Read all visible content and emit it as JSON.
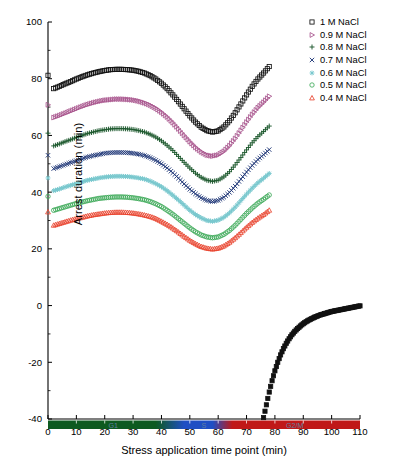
{
  "chart_data": {
    "type": "scatter",
    "title": "",
    "xlabel": "Stress application time point (min)",
    "ylabel": "Arrest duration (min)",
    "xlim": [
      0,
      110
    ],
    "ylim": [
      -40,
      100
    ],
    "xticks": [
      0,
      10,
      20,
      30,
      40,
      50,
      60,
      70,
      80,
      90,
      100,
      110
    ],
    "xticklabels": [
      "0",
      "10",
      "20",
      "30",
      "40",
      "50",
      "60",
      "70",
      "80",
      "90",
      "100",
      "110"
    ],
    "yticks": [
      -40,
      -20,
      0,
      20,
      40,
      60,
      80,
      100
    ],
    "yticklabels": [
      "-40",
      "-20",
      "0",
      "20",
      "40",
      "60",
      "80",
      "100"
    ],
    "grid": false,
    "legend_position": "top-right",
    "x": [
      0,
      2,
      4,
      6,
      8,
      10,
      12,
      14,
      16,
      18,
      20,
      22,
      24,
      26,
      28,
      30,
      32,
      34,
      36,
      38,
      40,
      42,
      44,
      46,
      48,
      50,
      52,
      54,
      56,
      58,
      60,
      62,
      64,
      66,
      68,
      70,
      72,
      74,
      76,
      78
    ],
    "series": [
      {
        "name": "1 M NaCl",
        "color": "#111111",
        "marker": "square-open",
        "values": [
          81.2,
          76.5,
          77.3,
          78.2,
          79.0,
          79.9,
          80.7,
          81.4,
          82.0,
          82.5,
          82.9,
          83.2,
          83.3,
          83.3,
          83.2,
          83.0,
          82.6,
          82.0,
          81.1,
          79.9,
          78.4,
          76.5,
          74.3,
          71.9,
          69.4,
          66.9,
          64.7,
          62.9,
          61.7,
          61.2,
          61.6,
          63.0,
          65.2,
          68.0,
          71.1,
          74.3,
          77.3,
          79.9,
          82.0,
          84.3
        ]
      },
      {
        "name": "0.9 M NaCl",
        "color": "#a8548c",
        "marker": "triangle-right-open",
        "values": [
          70.8,
          66.3,
          67.0,
          67.8,
          68.6,
          69.4,
          70.2,
          70.9,
          71.5,
          72.0,
          72.4,
          72.6,
          72.8,
          72.8,
          72.7,
          72.5,
          72.1,
          71.5,
          70.7,
          69.6,
          68.2,
          66.5,
          64.5,
          62.3,
          60.0,
          57.8,
          55.8,
          54.2,
          53.1,
          52.7,
          53.1,
          54.4,
          56.4,
          58.9,
          61.8,
          64.7,
          67.4,
          69.8,
          71.7,
          73.8
        ]
      },
      {
        "name": "0.8 M NaCl",
        "color": "#1e5a2e",
        "marker": "plus",
        "values": [
          60.8,
          56.3,
          57.0,
          57.8,
          58.5,
          59.3,
          60.0,
          60.7,
          61.2,
          61.7,
          62.0,
          62.3,
          62.4,
          62.4,
          62.3,
          62.1,
          61.7,
          61.2,
          60.4,
          59.4,
          58.1,
          56.5,
          54.7,
          52.6,
          50.5,
          48.5,
          46.7,
          45.2,
          44.2,
          43.8,
          44.2,
          45.4,
          47.2,
          49.6,
          52.2,
          54.9,
          57.4,
          59.6,
          61.4,
          63.3
        ]
      },
      {
        "name": "0.7 M NaCl",
        "color": "#243b7a",
        "marker": "x",
        "values": [
          53.0,
          48.3,
          49.0,
          49.7,
          50.4,
          51.1,
          51.8,
          52.4,
          52.9,
          53.3,
          53.7,
          53.9,
          54.0,
          54.0,
          53.9,
          53.7,
          53.4,
          52.9,
          52.2,
          51.2,
          50.0,
          48.5,
          46.8,
          44.9,
          42.9,
          41.0,
          39.4,
          38.0,
          37.1,
          36.7,
          37.1,
          38.2,
          39.9,
          42.1,
          44.6,
          47.1,
          49.4,
          51.5,
          53.2,
          55.0
        ]
      },
      {
        "name": "0.6 M NaCl",
        "color": "#79c8ce",
        "marker": "star-dot",
        "values": [
          45.0,
          40.5,
          41.1,
          41.8,
          42.4,
          43.0,
          43.6,
          44.2,
          44.6,
          45.0,
          45.3,
          45.5,
          45.6,
          45.6,
          45.5,
          45.3,
          45.0,
          44.6,
          43.9,
          43.0,
          41.9,
          40.5,
          38.9,
          37.2,
          35.4,
          33.6,
          32.1,
          30.9,
          30.0,
          29.7,
          30.1,
          31.1,
          32.7,
          34.7,
          37.0,
          39.3,
          41.4,
          43.3,
          44.9,
          46.6
        ]
      },
      {
        "name": "0.5 M NaCl",
        "color": "#3faa5a",
        "marker": "circle-open",
        "values": [
          38.5,
          33.6,
          34.2,
          34.8,
          35.4,
          36.0,
          36.5,
          37.0,
          37.4,
          37.8,
          38.0,
          38.2,
          38.3,
          38.3,
          38.2,
          38.0,
          37.7,
          37.3,
          36.7,
          35.9,
          34.9,
          33.6,
          32.2,
          30.6,
          29.0,
          27.4,
          26.0,
          24.9,
          24.2,
          23.9,
          24.2,
          25.1,
          26.5,
          28.3,
          30.4,
          32.5,
          34.4,
          36.1,
          37.5,
          39.0
        ]
      },
      {
        "name": "0.4 M NaCl",
        "color": "#e8452f",
        "marker": "triangle-up-open",
        "values": [
          33.0,
          28.3,
          28.9,
          29.5,
          30.1,
          30.6,
          31.1,
          31.6,
          32.0,
          32.3,
          32.6,
          32.8,
          32.9,
          32.9,
          32.8,
          32.6,
          32.3,
          31.9,
          31.4,
          30.7,
          29.7,
          28.6,
          27.3,
          25.9,
          24.4,
          23.0,
          21.8,
          20.8,
          20.2,
          19.9,
          20.2,
          21.0,
          22.3,
          23.9,
          25.7,
          27.6,
          29.3,
          30.8,
          32.1,
          33.6
        ]
      },
      {
        "name": "recovery",
        "color": "#111111",
        "marker": "square-filled",
        "x": [
          76,
          77,
          78,
          79,
          80,
          81,
          82,
          83,
          84,
          85,
          86,
          87,
          88,
          89,
          90,
          91,
          92,
          93,
          94,
          95,
          96,
          97,
          98,
          99,
          100,
          101,
          102,
          103,
          104,
          105,
          106,
          107,
          108,
          109,
          110
        ],
        "values": [
          -39.5,
          -35.0,
          -30.5,
          -26.5,
          -23.0,
          -20.0,
          -17.4,
          -15.2,
          -13.3,
          -11.7,
          -10.3,
          -9.1,
          -8.1,
          -7.2,
          -6.4,
          -5.7,
          -5.1,
          -4.6,
          -4.1,
          -3.7,
          -3.3,
          -3.0,
          -2.7,
          -2.4,
          -2.1,
          -1.9,
          -1.7,
          -1.5,
          -1.3,
          -1.1,
          -0.9,
          -0.7,
          -0.5,
          -0.3,
          -0.1
        ]
      }
    ],
    "phase_bar": {
      "segments": [
        {
          "label": "G1",
          "start": 0,
          "end": 46,
          "color": "#0d5a20"
        },
        {
          "label": "S",
          "start": 46,
          "end": 64,
          "color": "#1f4fc4"
        },
        {
          "label": "G2/M",
          "start": 64,
          "end": 110,
          "color": "#c01818"
        }
      ]
    }
  },
  "legend": {
    "items": [
      {
        "label": "1 M NaCl"
      },
      {
        "label": "0.9 M NaCl"
      },
      {
        "label": "0.8 M NaCl"
      },
      {
        "label": "0.7 M NaCl"
      },
      {
        "label": "0.6 M NaCl"
      },
      {
        "label": "0.5 M NaCl"
      },
      {
        "label": "0.4 M NaCl"
      }
    ]
  }
}
